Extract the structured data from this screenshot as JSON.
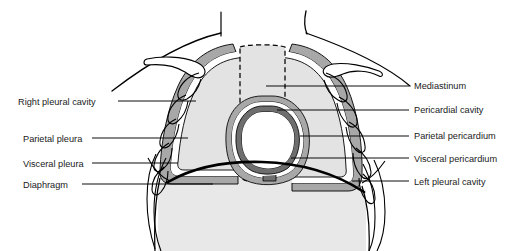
{
  "figure": {
    "type": "anatomical-diagram",
    "colors": {
      "outline": "#000000",
      "lung_fill": "#e3e3e3",
      "mediastinum_fill": "#e3e3e3",
      "abdomen_fill": "#e8e8e8",
      "parietal_pleura_band": "#a8a8a8",
      "parietal_pericardium_band": "#a8a8a8",
      "visceral_pericardium_band": "#6e6e6e",
      "pericardial_cavity_fill": "#ffffff",
      "heart_chamber_fill": "#ffffff",
      "leader_line": "#000000",
      "label_text": "#1a1a1a",
      "background": "#ffffff"
    }
  },
  "labels": {
    "left": [
      {
        "id": "right-pleural-cavity",
        "text": "Right pleural cavity",
        "x": 18,
        "y": 97,
        "leader_to_x": 180,
        "leader_to_y": 101
      },
      {
        "id": "parietal-pleura",
        "text": "Parietal pleura",
        "x": 23,
        "y": 134,
        "leader_to_x": 172,
        "leader_to_y": 138
      },
      {
        "id": "visceral-pleura",
        "text": "Visceral pleura",
        "x": 23,
        "y": 159,
        "leader_to_x": 165,
        "leader_to_y": 163
      },
      {
        "id": "diaphragm",
        "text": "Diaphragm",
        "x": 23,
        "y": 180,
        "leader_to_x": 200,
        "leader_to_y": 184
      }
    ],
    "right": [
      {
        "id": "mediastinum",
        "text": "Mediastinum",
        "x": 414,
        "y": 81,
        "leader_to_x": 266,
        "leader_to_y": 86
      },
      {
        "id": "pericardial-cavity",
        "text": "Pericardial cavity",
        "x": 414,
        "y": 105,
        "leader_to_x": 275,
        "leader_to_y": 110
      },
      {
        "id": "parietal-pericardium",
        "text": "Parietal pericardium",
        "x": 414,
        "y": 131,
        "leader_to_x": 297,
        "leader_to_y": 136
      },
      {
        "id": "visceral-pericardium",
        "text": "Visceral pericardium",
        "x": 414,
        "y": 154,
        "leader_to_x": 290,
        "leader_to_y": 158
      },
      {
        "id": "left-pleural-cavity",
        "text": "Left pleural cavity",
        "x": 414,
        "y": 177,
        "leader_to_x": 349,
        "leader_to_y": 181
      }
    ]
  }
}
